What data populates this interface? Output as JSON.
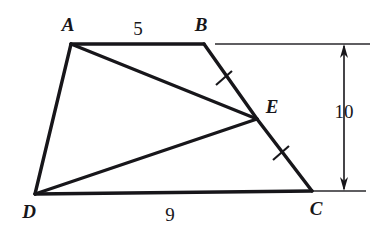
{
  "figure": {
    "background_color": "#ffffff",
    "ink_color": "#17161a",
    "vertices": [
      {
        "id": "A",
        "label": "A",
        "x": 71,
        "y": 44,
        "label_x": 68,
        "label_y": 31
      },
      {
        "id": "B",
        "label": "B",
        "x": 204,
        "y": 44,
        "label_x": 201,
        "label_y": 31
      },
      {
        "id": "C",
        "label": "C",
        "x": 312,
        "y": 191,
        "label_x": 316,
        "label_y": 212
      },
      {
        "id": "D",
        "label": "D",
        "x": 35,
        "y": 194,
        "label_x": 26,
        "label_y": 215
      },
      {
        "id": "E",
        "label": "E",
        "x": 257,
        "y": 119,
        "label_x": 268,
        "label_y": 113
      }
    ],
    "edges": [
      {
        "name": "edge-ab",
        "from": "A",
        "to": "B",
        "kind": "side"
      },
      {
        "name": "edge-be",
        "from": "B",
        "to": "E",
        "kind": "side"
      },
      {
        "name": "edge-ec",
        "from": "E",
        "to": "C",
        "kind": "side"
      },
      {
        "name": "edge-cd",
        "from": "C",
        "to": "D",
        "kind": "side"
      },
      {
        "name": "edge-da",
        "from": "D",
        "to": "A",
        "kind": "side"
      },
      {
        "name": "edge-ae",
        "from": "A",
        "to": "E",
        "kind": "diagonal"
      },
      {
        "name": "edge-de",
        "from": "D",
        "to": "E",
        "kind": "diagonal"
      }
    ],
    "tick_marks": [
      {
        "name": "tick-be",
        "on_segment": "BE",
        "x": 224,
        "y": 78,
        "angle_deg": 53
      },
      {
        "name": "tick-ec",
        "on_segment": "EC",
        "x": 281,
        "y": 153,
        "angle_deg": 53
      }
    ],
    "length_labels": [
      {
        "name": "length-ab",
        "text": "5",
        "x": 138,
        "y": 34,
        "segment": "AB"
      },
      {
        "name": "length-dc",
        "text": "9",
        "x": 170,
        "y": 219,
        "segment": "DC"
      }
    ],
    "dimension": {
      "name": "height-dimension",
      "text": "10",
      "label_x": 342,
      "label_y": 117,
      "axis_x": 344,
      "top_y": 44,
      "bottom_y": 191,
      "extension_top": {
        "x1": 215,
        "y1": 44,
        "x2": 370,
        "y2": 44
      },
      "extension_bottom": {
        "x1": 312,
        "y1": 191,
        "x2": 366,
        "y2": 191
      }
    }
  }
}
